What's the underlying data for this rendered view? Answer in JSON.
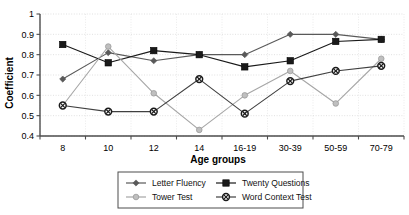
{
  "chart_data": {
    "type": "line",
    "title": "",
    "xlabel": "Age groups",
    "ylabel": "Coefficient",
    "categories": [
      "8",
      "10",
      "12",
      "14",
      "16-19",
      "30-39",
      "50-59",
      "70-79"
    ],
    "ylim": [
      0.4,
      1.0
    ],
    "yticks": [
      "0.4",
      "0.5",
      "0.6",
      "0.7",
      "0.8",
      "0.9",
      "1"
    ],
    "grid": true,
    "legend_position": "bottom",
    "series": [
      {
        "name": "Letter Fluency",
        "marker": "diamond",
        "color": "#595959",
        "values": [
          0.68,
          0.81,
          0.77,
          0.8,
          0.8,
          0.9,
          0.9,
          0.875
        ]
      },
      {
        "name": "Twenty Questions",
        "marker": "square",
        "color": "#1a1a1a",
        "values": [
          0.85,
          0.76,
          0.82,
          0.8,
          0.74,
          0.77,
          0.865,
          0.875
        ]
      },
      {
        "name": "Tower Test",
        "marker": "circle",
        "color": "#a6a6a6",
        "values": [
          0.55,
          0.84,
          0.61,
          0.43,
          0.6,
          0.72,
          0.56,
          0.78
        ]
      },
      {
        "name": "Word Context Test",
        "marker": "circle-x",
        "color": "#404040",
        "values": [
          0.55,
          0.52,
          0.52,
          0.68,
          0.51,
          0.67,
          0.72,
          0.745
        ]
      }
    ]
  },
  "axis": {
    "x_title": "Age groups",
    "y_title": "Coefficient"
  },
  "legend": {
    "items": [
      {
        "label": "Letter Fluency"
      },
      {
        "label": "Twenty Questions"
      },
      {
        "label": "Tower Test"
      },
      {
        "label": "Word Context Test"
      }
    ]
  }
}
